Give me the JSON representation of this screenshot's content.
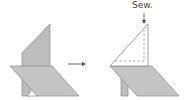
{
  "diagram": {
    "instruction_label": "Sew.",
    "colors": {
      "fabric_fill": "#bdbdbd",
      "outline": "#8a8a8a",
      "arrow": "#555555",
      "seam": "#888888",
      "background": "#ffffff"
    },
    "steps": [
      {
        "name": "before",
        "description": "Folded triangle flap standing behind parallelogram piece"
      },
      {
        "name": "after",
        "description": "Triangle flap folded to white side with dashed sewing line"
      }
    ]
  }
}
